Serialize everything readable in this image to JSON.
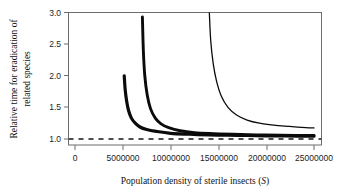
{
  "chart_data": {
    "type": "line",
    "title": "",
    "xlabel": "Population density of sterile insects (S)",
    "xlabel_plain": "Population density of sterile insects",
    "xlabel_symbol": "S",
    "ylabel": "Relative time for eradication of related species",
    "ylabel_line1": "Relative time for eradication of",
    "ylabel_line2": "related species",
    "xlim": [
      0,
      25000000
    ],
    "ylim": [
      1.0,
      3.0
    ],
    "xticks": [
      0,
      5000000,
      10000000,
      15000000,
      20000000,
      25000000
    ],
    "xtick_labels": [
      "0",
      "5000000",
      "10000000",
      "15000000",
      "20000000",
      "25000000"
    ],
    "yticks": [
      1.0,
      1.5,
      2.0,
      2.5,
      3.0
    ],
    "ytick_labels": [
      "1.0",
      "1.5",
      "2.0",
      "2.5",
      "3.0"
    ],
    "grid": false,
    "legend": "none",
    "reference_line": {
      "name": "asymptote-y-equals-one",
      "orientation": "horizontal",
      "y": 1.0,
      "style": "dashed",
      "color": "#131313"
    },
    "series": [
      {
        "name": "curve-1",
        "style": "solid-thick",
        "color": "#0b0b0b",
        "linewidth": 3.2,
        "vertical_asymptote_x": 5000000,
        "x": [
          5150000,
          5250000,
          5400000,
          5600000,
          5900000,
          6300000,
          6800000,
          7500000,
          8500000,
          10000000,
          12000000,
          14000000,
          16000000,
          18000000,
          20000000,
          22000000,
          25000000
        ],
        "y": [
          2.0,
          1.78,
          1.6,
          1.45,
          1.33,
          1.25,
          1.19,
          1.15,
          1.12,
          1.09,
          1.075,
          1.065,
          1.06,
          1.055,
          1.05,
          1.048,
          1.045
        ]
      },
      {
        "name": "curve-2",
        "style": "solid-thick",
        "color": "#0b0b0b",
        "linewidth": 2.9,
        "vertical_asymptote_x": 7000000,
        "x": [
          7050000,
          7150000,
          7300000,
          7550000,
          7900000,
          8400000,
          9000000,
          9800000,
          11000000,
          12500000,
          14500000,
          16500000,
          19000000,
          21500000,
          25000000
        ],
        "y": [
          2.93,
          2.4,
          2.0,
          1.7,
          1.48,
          1.33,
          1.24,
          1.18,
          1.13,
          1.1,
          1.085,
          1.075,
          1.065,
          1.06,
          1.055
        ]
      },
      {
        "name": "curve-3",
        "style": "solid-thin",
        "color": "#0b0b0b",
        "linewidth": 1.3,
        "vertical_asymptote_x": 14000000,
        "x": [
          14050000,
          14200000,
          14450000,
          14800000,
          15300000,
          16000000,
          16900000,
          18000000,
          19300000,
          20800000,
          22400000,
          23700000,
          25000000
        ],
        "y": [
          3.0,
          2.55,
          2.2,
          1.92,
          1.68,
          1.5,
          1.38,
          1.3,
          1.25,
          1.22,
          1.2,
          1.185,
          1.175
        ]
      }
    ]
  },
  "axes": {
    "frame_color": "#6d6d6d",
    "background": "#ffffff"
  }
}
